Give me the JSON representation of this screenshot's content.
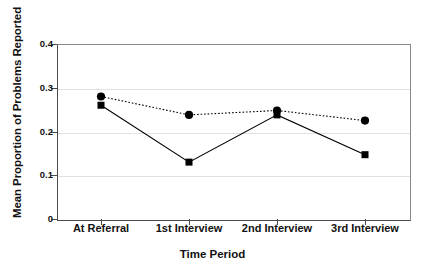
{
  "chart_data": {
    "type": "line",
    "title": "",
    "xlabel": "Time Period",
    "ylabel": "Mean Proportion of Problems Reported",
    "categories": [
      "At Referral",
      "1st Interview",
      "2nd Interview",
      "3rd Interview"
    ],
    "series": [
      {
        "name": "dotted-series",
        "marker": "circle",
        "linestyle": "dotted",
        "color": "#000000",
        "values": [
          0.28,
          0.238,
          0.248,
          0.225
        ]
      },
      {
        "name": "solid-series",
        "marker": "square",
        "linestyle": "solid",
        "color": "#000000",
        "values": [
          0.26,
          0.13,
          0.238,
          0.147
        ]
      }
    ],
    "ylim": [
      0,
      0.4
    ],
    "y_ticks": [
      "0",
      "0.1",
      "0.2",
      "0.3",
      "0.4"
    ],
    "y_tick_values": [
      0,
      0.1,
      0.2,
      0.3,
      0.4
    ],
    "grid": true,
    "legend": false
  },
  "axis": {
    "y_title": "Mean Proportion of Problems Reported",
    "x_title": "Time Period"
  }
}
